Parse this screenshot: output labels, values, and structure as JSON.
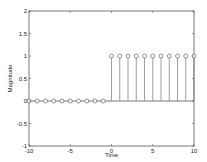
{
  "chart_data": {
    "type": "stem",
    "title": "",
    "xlabel": "Time",
    "ylabel": "Magnitude",
    "xlim": [
      -10,
      10
    ],
    "ylim": [
      -1,
      2
    ],
    "grid": false,
    "x_ticks": [
      -10,
      -5,
      0,
      5,
      10
    ],
    "x_tick_labels": [
      "-10",
      "-5",
      "0",
      "5",
      "10"
    ],
    "y_ticks": [
      -1,
      -0.5,
      0,
      0.5,
      1,
      1.5,
      2
    ],
    "y_tick_labels": [
      "-1",
      "-0.5",
      "0",
      "0.5",
      "1",
      "1.5",
      "2"
    ],
    "series": [
      {
        "name": "unit step",
        "marker": "circle",
        "x": [
          -10,
          -9,
          -8,
          -7,
          -6,
          -5,
          -4,
          -3,
          -2,
          -1,
          0,
          1,
          2,
          3,
          4,
          5,
          6,
          7,
          8,
          9,
          10
        ],
        "values": [
          0,
          0,
          0,
          0,
          0,
          0,
          0,
          0,
          0,
          0,
          1,
          1,
          1,
          1,
          1,
          1,
          1,
          1,
          1,
          1,
          1
        ]
      }
    ],
    "baseline": 0
  },
  "colors": {
    "axes": "#555555",
    "stem": "#777777",
    "marker": "#666666",
    "baseline": "#555555",
    "background": "#ffffff"
  }
}
